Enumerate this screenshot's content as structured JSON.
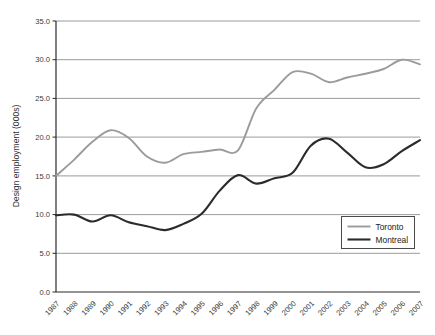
{
  "chart_data": {
    "type": "line",
    "title": "",
    "xlabel": "",
    "ylabel": "Design employment (000s)",
    "categories": [
      "1987",
      "1988",
      "1989",
      "1990",
      "1991",
      "1992",
      "1993",
      "1994",
      "1995",
      "1996",
      "1997",
      "1998",
      "1999",
      "2000",
      "2001",
      "2002",
      "2003",
      "2004",
      "2005",
      "2006",
      "2007"
    ],
    "series": [
      {
        "name": "Toronto",
        "color": "#9b9b9b",
        "values": [
          15.0,
          17.1,
          19.4,
          20.9,
          19.9,
          17.5,
          16.7,
          17.8,
          18.1,
          18.4,
          18.3,
          23.7,
          26.1,
          28.4,
          28.2,
          27.1,
          27.7,
          28.2,
          28.8,
          30.0,
          29.4
        ]
      },
      {
        "name": "Montreal",
        "color": "#2b2b2b",
        "values": [
          9.9,
          10.0,
          9.1,
          9.9,
          9.0,
          8.5,
          8.0,
          8.8,
          10.1,
          13.1,
          15.1,
          14.0,
          14.7,
          15.4,
          18.9,
          19.8,
          18.0,
          16.1,
          16.5,
          18.2,
          19.6
        ]
      }
    ],
    "ylim": [
      0,
      35
    ],
    "ytick_step": 5,
    "ytick_labels": [
      "0.0",
      "5.0",
      "10.0",
      "15.0",
      "20.0",
      "25.0",
      "30.0",
      "35.0"
    ],
    "grid": "horizontal",
    "legend_position": "lower-right",
    "line_style": "smooth"
  },
  "style": {
    "background": "#ffffff",
    "grid_color": "#8f8f8f",
    "axis_color": "#2b2b2b",
    "text_color": "#3a3a3a",
    "legend_border_color": "#4a4a4a"
  }
}
